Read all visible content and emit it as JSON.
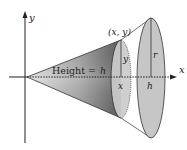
{
  "diagram": {
    "type": "solid-of-revolution-cone",
    "colors": {
      "cone_dark": "#6a6a6a",
      "cone_light": "#d4d4d4",
      "disk_fill": "#c8c8c8",
      "stroke": "#333333",
      "background": "#ffffff"
    },
    "axes": {
      "x_label": "x",
      "y_label": "y"
    },
    "labels": {
      "point": "(x, y)",
      "height_prefix": "Height = ",
      "height_var": "h",
      "cross_section_radius": "y",
      "cross_section_position": "x",
      "base_radius": "r",
      "base_position": "h"
    }
  }
}
